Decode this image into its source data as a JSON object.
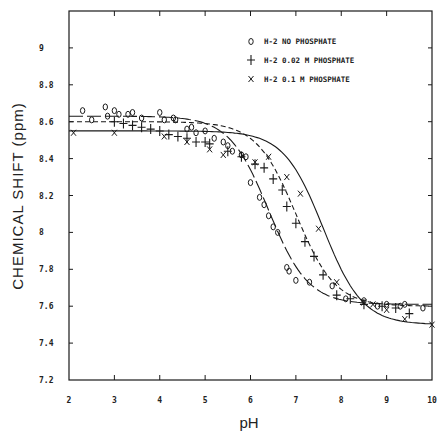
{
  "chart_data": {
    "type": "scatter",
    "title": "",
    "xlabel": "pH",
    "ylabel": "CHEMICAL SHIFT (ppm)",
    "xlim": [
      2,
      10
    ],
    "ylim": [
      7.2,
      9.2
    ],
    "xticks": [
      2,
      3,
      4,
      5,
      6,
      7,
      8,
      9,
      10
    ],
    "yticks": [
      7.2,
      7.4,
      7.6,
      7.8,
      8,
      8.2,
      8.4,
      8.6,
      8.8,
      9
    ],
    "xtick_labels": [
      "2",
      "3",
      "4",
      "5",
      "6",
      "7",
      "8",
      "9",
      "10"
    ],
    "ytick_labels": [
      "7.2",
      "7.4",
      "7.6",
      "7.8",
      "8",
      "8.2",
      "8.4",
      "8.6",
      "8.8",
      "9"
    ],
    "grid": false,
    "legend_position": "upper right (inside)",
    "series": [
      {
        "name": "H-2 NO PHOSPHATE",
        "marker": "o",
        "marker_glyph": "0",
        "fit_line": "solid-dash",
        "fit": {
          "high": 8.63,
          "low": 7.61,
          "pKa": 6.4
        },
        "points": [
          [
            2.3,
            8.66
          ],
          [
            2.5,
            8.61
          ],
          [
            2.8,
            8.68
          ],
          [
            2.85,
            8.63
          ],
          [
            3.0,
            8.66
          ],
          [
            3.1,
            8.64
          ],
          [
            3.3,
            8.64
          ],
          [
            3.4,
            8.65
          ],
          [
            3.6,
            8.62
          ],
          [
            4.0,
            8.65
          ],
          [
            4.1,
            8.61
          ],
          [
            4.3,
            8.62
          ],
          [
            4.35,
            8.61
          ],
          [
            4.6,
            8.56
          ],
          [
            4.7,
            8.57
          ],
          [
            4.8,
            8.54
          ],
          [
            5.0,
            8.55
          ],
          [
            5.2,
            8.51
          ],
          [
            5.4,
            8.49
          ],
          [
            5.5,
            8.47
          ],
          [
            5.6,
            8.44
          ],
          [
            5.8,
            8.42
          ],
          [
            5.9,
            8.41
          ],
          [
            6.0,
            8.27
          ],
          [
            6.2,
            8.19
          ],
          [
            6.3,
            8.15
          ],
          [
            6.4,
            8.09
          ],
          [
            6.5,
            8.03
          ],
          [
            6.6,
            8.0
          ],
          [
            6.8,
            7.81
          ],
          [
            6.85,
            7.79
          ],
          [
            7.0,
            7.74
          ],
          [
            7.3,
            7.73
          ],
          [
            7.8,
            7.71
          ],
          [
            8.1,
            7.64
          ],
          [
            8.5,
            7.63
          ],
          [
            8.8,
            7.6
          ],
          [
            9.0,
            7.61
          ],
          [
            9.3,
            7.6
          ],
          [
            9.4,
            7.61
          ],
          [
            9.8,
            7.59
          ]
        ]
      },
      {
        "name": "H-2 0.02 M PHOSPHATE",
        "marker": "+",
        "marker_glyph": "+",
        "fit_line": "dashed",
        "fit": {
          "high": 8.6,
          "low": 7.6,
          "pKa": 7.0
        },
        "points": [
          [
            3.0,
            8.6
          ],
          [
            3.2,
            8.59
          ],
          [
            3.4,
            8.58
          ],
          [
            3.6,
            8.57
          ],
          [
            3.8,
            8.56
          ],
          [
            4.0,
            8.55
          ],
          [
            4.2,
            8.53
          ],
          [
            4.4,
            8.52
          ],
          [
            4.6,
            8.51
          ],
          [
            4.8,
            8.49
          ],
          [
            5.0,
            8.49
          ],
          [
            5.1,
            8.48
          ],
          [
            5.5,
            8.44
          ],
          [
            5.8,
            8.41
          ],
          [
            6.1,
            8.37
          ],
          [
            6.3,
            8.35
          ],
          [
            6.5,
            8.29
          ],
          [
            6.7,
            8.23
          ],
          [
            6.8,
            8.14
          ],
          [
            7.0,
            8.05
          ],
          [
            7.2,
            7.95
          ],
          [
            7.4,
            7.87
          ],
          [
            7.6,
            7.77
          ],
          [
            7.9,
            7.66
          ],
          [
            8.2,
            7.64
          ],
          [
            8.5,
            7.61
          ],
          [
            8.9,
            7.6
          ],
          [
            9.2,
            7.59
          ],
          [
            9.5,
            7.56
          ]
        ]
      },
      {
        "name": "H-2 0.1 M PHOSPHATE",
        "marker": "x",
        "marker_glyph": "x",
        "fit_line": "solid",
        "fit": {
          "high": 8.55,
          "low": 7.5,
          "pKa": 7.6
        },
        "points": [
          [
            2.1,
            8.54
          ],
          [
            3.0,
            8.54
          ],
          [
            4.1,
            8.52
          ],
          [
            4.6,
            8.49
          ],
          [
            5.1,
            8.45
          ],
          [
            5.4,
            8.42
          ],
          [
            6.1,
            8.38
          ],
          [
            6.4,
            8.41
          ],
          [
            6.8,
            8.3
          ],
          [
            7.1,
            8.21
          ],
          [
            7.5,
            8.02
          ],
          [
            7.9,
            7.73
          ],
          [
            8.5,
            7.62
          ],
          [
            8.7,
            7.61
          ],
          [
            9.0,
            7.58
          ],
          [
            9.4,
            7.53
          ],
          [
            10.0,
            7.5
          ]
        ]
      }
    ]
  }
}
